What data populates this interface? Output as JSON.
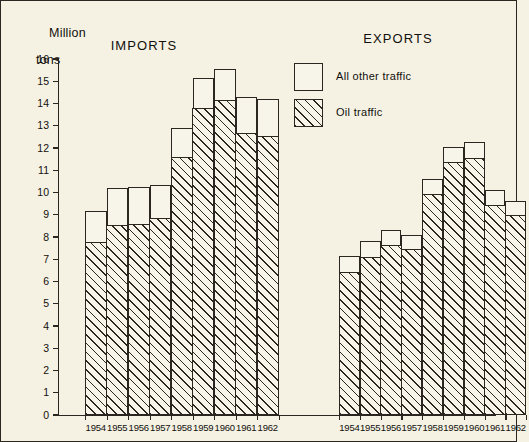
{
  "axis": {
    "y_title_line1": "Million",
    "y_title_line2": "tons",
    "y_ticks": [
      "16",
      "15",
      "14",
      "13",
      "12",
      "11",
      "10",
      "9",
      "8",
      "7",
      "6",
      "5",
      "4",
      "3",
      "2",
      "1",
      "0"
    ]
  },
  "panels": {
    "imports_title": "IMPORTS",
    "exports_title": "EXPORTS"
  },
  "legend": {
    "items": [
      {
        "label": "All other traffic",
        "pattern": "solid-white"
      },
      {
        "label": "Oil traffic",
        "pattern": "diagonal-hatch"
      }
    ]
  },
  "chart_data": {
    "type": "bar",
    "title": "Million tons",
    "xlabel": "",
    "ylabel": "Million tons",
    "ylim": [
      0,
      16
    ],
    "ytick_step": 1,
    "grid": false,
    "legend_position": "upper-right",
    "stacked": true,
    "panels": [
      {
        "name": "IMPORTS",
        "categories": [
          "1954",
          "1955",
          "1956",
          "1957",
          "1958",
          "1959",
          "1960",
          "1961",
          "1962"
        ],
        "series": [
          {
            "name": "Oil traffic",
            "values": [
              7.8,
              8.55,
              8.6,
              8.85,
              11.6,
              13.8,
              14.15,
              12.7,
              12.55
            ]
          },
          {
            "name": "All other traffic",
            "values": [
              1.35,
              1.65,
              1.65,
              1.5,
              1.3,
              1.35,
              1.4,
              1.6,
              1.65
            ]
          }
        ],
        "totals": [
          9.15,
          10.2,
          10.25,
          10.35,
          12.9,
          15.15,
          15.55,
          14.3,
          14.2
        ]
      },
      {
        "name": "EXPORTS",
        "categories": [
          "1954",
          "1955",
          "1956",
          "1957",
          "1958",
          "1959",
          "1960",
          "1961",
          "1962"
        ],
        "series": [
          {
            "name": "Oil traffic",
            "values": [
              6.45,
              7.1,
              7.65,
              7.45,
              9.95,
              11.4,
              11.55,
              9.45,
              9.0
            ]
          },
          {
            "name": "All other traffic",
            "values": [
              0.7,
              0.7,
              0.65,
              0.65,
              0.65,
              0.65,
              0.7,
              0.65,
              0.6
            ]
          }
        ],
        "totals": [
          7.15,
          7.8,
          8.3,
          8.1,
          10.6,
          12.05,
          12.25,
          10.1,
          9.6
        ]
      }
    ]
  },
  "colors": {
    "ink": "#2b2720",
    "paper": "#f5f2e4",
    "bar_fill": "#f7f5e9"
  }
}
